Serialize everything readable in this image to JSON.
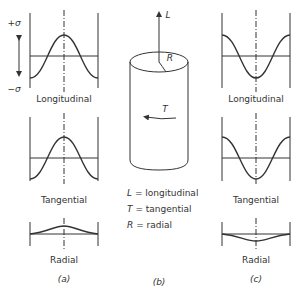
{
  "figure": {
    "panels": [
      {
        "id": "a",
        "caption": "(a)",
        "plots": [
          {
            "label": "Longitudinal",
            "shape": "cosine-peak"
          },
          {
            "label": "Tangential",
            "shape": "cosine-peak"
          },
          {
            "label": "Radial",
            "shape": "small-bump-up"
          }
        ]
      },
      {
        "id": "b",
        "caption": "(b)"
      },
      {
        "id": "c",
        "caption": "(c)",
        "plots": [
          {
            "label": "Longitudinal",
            "shape": "cosine-trough"
          },
          {
            "label": "Tangential",
            "shape": "cosine-trough"
          },
          {
            "label": "Radial",
            "shape": "small-bump-down"
          }
        ]
      }
    ],
    "axis": {
      "plus": "+σ",
      "minus": "−σ"
    },
    "cylinder": {
      "L": "L",
      "R": "R",
      "T": "T"
    },
    "legend": [
      {
        "sym": "L",
        "text": "= longitudinal"
      },
      {
        "sym": "T",
        "text": "= tangential"
      },
      {
        "sym": "R",
        "text": "= radial"
      }
    ]
  }
}
